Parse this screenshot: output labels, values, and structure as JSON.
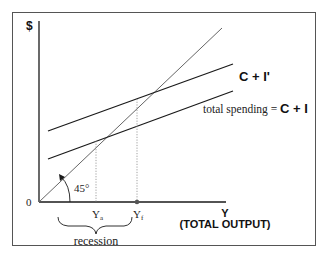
{
  "diagram": {
    "y_axis_label": "$",
    "x_axis_label_line1": "Y",
    "x_axis_label_line2": "(TOTAL OUTPUT)",
    "origin_label": "0",
    "angle_label": "45°",
    "curves": {
      "upper": {
        "label": "C + I'"
      },
      "lower": {
        "label_prefix": "total spending = ",
        "label_bold": "C + I"
      }
    },
    "ticks": {
      "ya": {
        "label": "Y",
        "subscript": "a"
      },
      "yf": {
        "label": "Y",
        "subscript": "f"
      }
    },
    "brace_label": "recession",
    "colors": {
      "lines": "#1a1a1a",
      "guide_line": "#666666",
      "frame": "#555555"
    }
  }
}
